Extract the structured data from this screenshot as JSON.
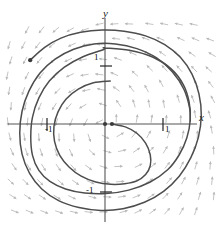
{
  "figure": {
    "kind": "phase-portrait-direction-field",
    "background": "#ffffff",
    "axis_color": "#555555",
    "curve_color": "#4d4d4d",
    "field_color": "#b8b8b8",
    "point_color": "#3a3a3a"
  },
  "axes": {
    "x_label": "x",
    "y_label": "y",
    "origin_px": [
      105,
      124
    ],
    "unit_px": 58,
    "x_range": [
      -1.81,
      1.98
    ],
    "y_range": [
      -1.83,
      2.14
    ]
  },
  "ticks": {
    "y_positive": "1",
    "y_negative": "-1",
    "x_negative": "-1",
    "x_positive": "1"
  },
  "chart_data": {
    "type": "line",
    "title": "",
    "xlabel": "x",
    "ylabel": "y",
    "xlim": [
      -1.81,
      1.98
    ],
    "ylim": [
      -1.83,
      2.14
    ],
    "grid": false,
    "legend": "none",
    "annotations": [
      {
        "label": "origin-point",
        "x": 0,
        "y": 0
      },
      {
        "label": "inner-start-point",
        "x": 0.12,
        "y": 0.0
      },
      {
        "label": "outer-start-point",
        "x": -1.29,
        "y": 1.1
      }
    ],
    "series": [
      {
        "name": "limit-cycle",
        "kind": "closed-orbit",
        "x": [
          0.0,
          0.42,
          0.83,
          1.14,
          1.35,
          1.45,
          1.47,
          1.41,
          1.28,
          1.08,
          0.78,
          0.41,
          0.02,
          -0.35,
          -0.68,
          -0.95,
          -1.14,
          -1.25,
          -1.28,
          -1.25,
          -1.14,
          -0.96,
          -0.7,
          -0.38,
          -0.03,
          0.0
        ],
        "y": [
          1.31,
          1.27,
          1.15,
          0.95,
          0.68,
          0.38,
          0.07,
          -0.24,
          -0.53,
          -0.79,
          -1.0,
          -1.14,
          -1.2,
          -1.19,
          -1.12,
          -0.99,
          -0.8,
          -0.54,
          -0.22,
          0.12,
          0.45,
          0.74,
          0.98,
          1.16,
          1.28,
          1.31
        ]
      },
      {
        "name": "outer-trajectory",
        "kind": "inward-spiral",
        "x": [
          -1.29,
          -1.04,
          -0.76,
          -0.42,
          -0.05,
          0.33,
          0.7,
          1.03,
          1.3,
          1.5,
          1.62,
          1.66,
          1.61,
          1.48,
          1.28,
          1.01,
          0.68,
          0.31,
          -0.07,
          -0.45,
          -0.8,
          -1.09,
          -1.3,
          -1.43,
          -1.47,
          -1.43,
          -1.31,
          -1.12,
          -0.86,
          -0.54,
          -0.19,
          0.18,
          0.55,
          0.89,
          1.16,
          1.36,
          1.46,
          1.47
        ],
        "y": [
          1.1,
          1.32,
          1.48,
          1.58,
          1.62,
          1.6,
          1.52,
          1.37,
          1.15,
          0.86,
          0.52,
          0.15,
          -0.23,
          -0.58,
          -0.9,
          -1.16,
          -1.35,
          -1.46,
          -1.49,
          -1.44,
          -1.32,
          -1.12,
          -0.85,
          -0.52,
          -0.16,
          0.22,
          0.57,
          0.88,
          1.12,
          1.29,
          1.38,
          1.38,
          1.3,
          1.14,
          0.9,
          0.6,
          0.27,
          0.05
        ]
      },
      {
        "name": "inner-trajectory",
        "kind": "outward-spiral",
        "x": [
          0.12,
          0.35,
          0.55,
          0.7,
          0.78,
          0.78,
          0.7,
          0.55,
          0.34,
          0.1,
          -0.16,
          -0.41,
          -0.62,
          -0.78,
          -0.87,
          -0.88,
          -0.81,
          -0.67,
          -0.46,
          -0.2,
          0.09
        ],
        "y": [
          0.0,
          -0.05,
          -0.16,
          -0.33,
          -0.53,
          -0.72,
          -0.87,
          -0.98,
          -1.03,
          -1.04,
          -1.0,
          -0.9,
          -0.74,
          -0.54,
          -0.3,
          -0.04,
          0.21,
          0.43,
          0.6,
          0.71,
          0.74
        ]
      }
    ],
    "vector_field": {
      "description": "counterclockwise rotational direction field arrows on a grid",
      "arrow_count": 132,
      "rotation": "counterclockwise",
      "color": "#b8b8b8"
    }
  }
}
